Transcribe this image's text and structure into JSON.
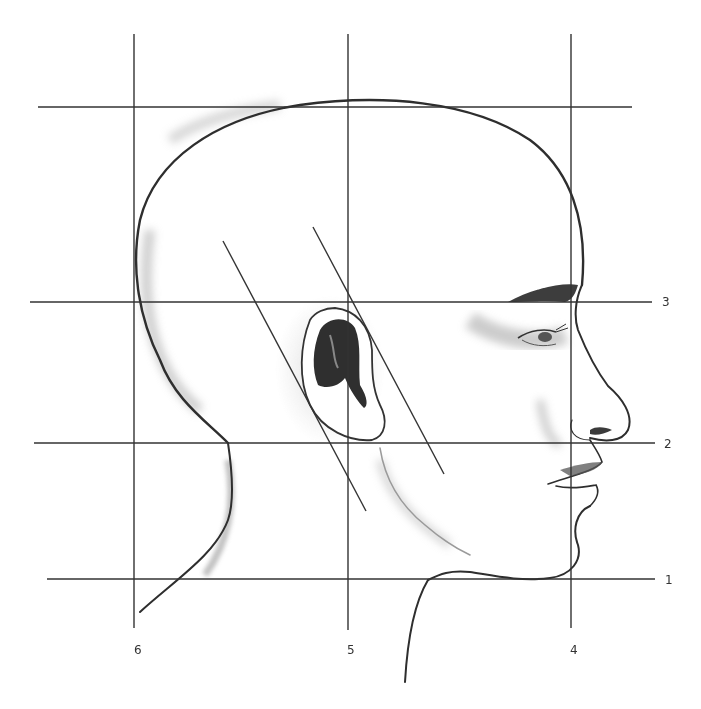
{
  "figure": {
    "line_color": "#333333",
    "shade_color": "#8a8a8a",
    "horizontal_lines": [
      {
        "id": "top",
        "y": 107,
        "x1": 38,
        "x2": 632,
        "label": ""
      },
      {
        "id": "3",
        "y": 302,
        "x1": 30,
        "x2": 652,
        "label": "3"
      },
      {
        "id": "2",
        "y": 443,
        "x1": 34,
        "x2": 655,
        "label": "2"
      },
      {
        "id": "1",
        "y": 579,
        "x1": 47,
        "x2": 655,
        "label": "1"
      }
    ],
    "vertical_lines": [
      {
        "id": "6",
        "x": 134,
        "y1": 34,
        "y2": 628,
        "label": "6"
      },
      {
        "id": "5",
        "x": 348,
        "y1": 34,
        "y2": 630,
        "label": "5"
      },
      {
        "id": "4",
        "x": 571,
        "y1": 34,
        "y2": 628,
        "label": "4"
      }
    ],
    "diagonal_lines": [
      {
        "x1": 223,
        "y1": 241,
        "x2": 366,
        "y2": 511
      },
      {
        "x1": 313,
        "y1": 227,
        "x2": 444,
        "y2": 474
      }
    ],
    "labels": {
      "h3": "3",
      "h2": "2",
      "h1": "1",
      "v6": "6",
      "v5": "5",
      "v4": "4"
    }
  }
}
